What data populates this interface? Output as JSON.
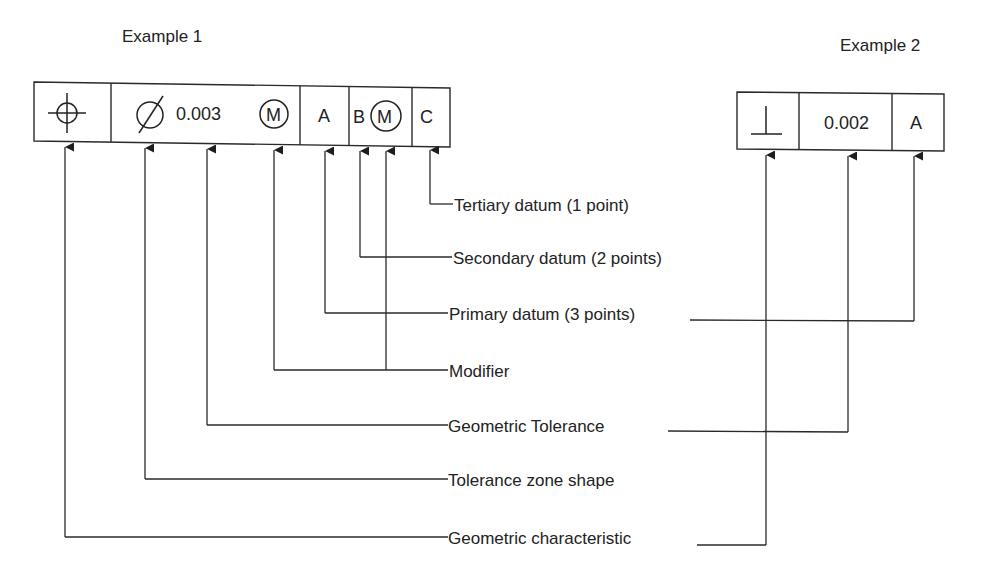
{
  "examples": [
    {
      "title": "Example 1",
      "frame": {
        "cells": [
          {
            "role": "geometric-characteristic",
            "symbol": "position",
            "icon": "position-icon"
          },
          {
            "role": "tolerance",
            "zone_shape_icon": "diameter-icon",
            "value": "0.003",
            "modifier": "M"
          },
          {
            "role": "primary-datum",
            "value": "A"
          },
          {
            "role": "secondary-datum",
            "value": "B",
            "modifier": "M"
          },
          {
            "role": "tertiary-datum",
            "value": "C"
          }
        ]
      }
    },
    {
      "title": "Example 2",
      "frame": {
        "cells": [
          {
            "role": "geometric-characteristic",
            "symbol": "perpendicularity",
            "icon": "perpendicularity-icon"
          },
          {
            "role": "tolerance",
            "value": "0.002"
          },
          {
            "role": "primary-datum",
            "value": "A"
          }
        ]
      }
    }
  ],
  "callouts": {
    "tertiary": "Tertiary datum (1 point)",
    "secondary": "Secondary datum (2 points)",
    "primary": "Primary datum (3 points)",
    "modifier": "Modifier",
    "geometric_tolerance": "Geometric Tolerance",
    "tolerance_zone_shape": "Tolerance zone shape",
    "geometric_characteristic": "Geometric characteristic"
  },
  "colors": {
    "line": "#2a2a2a",
    "text": "#222222",
    "background": "#ffffff"
  }
}
